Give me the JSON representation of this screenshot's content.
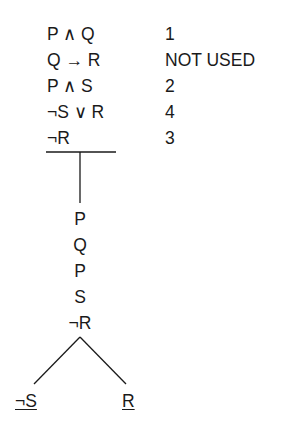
{
  "premises": [
    {
      "formula": "P ∧ Q",
      "note": "1"
    },
    {
      "formula": "Q → R",
      "note": "NOT USED"
    },
    {
      "formula": "P ∧ S",
      "note": "2"
    },
    {
      "formula": "¬S ∨ R",
      "note": "4"
    },
    {
      "formula": "¬R",
      "note": "3"
    }
  ],
  "trunk": [
    "P",
    "Q",
    "P",
    "S",
    "¬R"
  ],
  "branches": {
    "left": "¬S",
    "right": "R"
  },
  "colors": {
    "ink": "#1a1a1a",
    "background": "#ffffff"
  }
}
